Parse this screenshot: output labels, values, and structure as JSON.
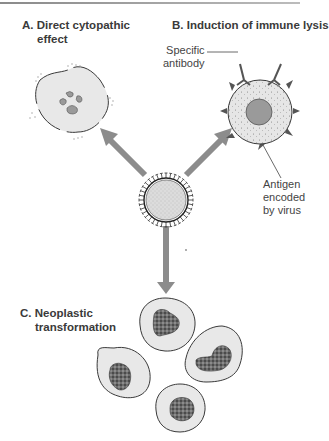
{
  "panels": {
    "a": {
      "letter": "A.",
      "line1": "Direct cytopathic",
      "line2": "effect"
    },
    "b": {
      "letter": "B.",
      "line1": "Induction of immune lysis"
    },
    "c": {
      "letter": "C.",
      "line1": "Neoplastic",
      "line2": "transformation"
    }
  },
  "annotations": {
    "antibody": {
      "line1": "Specific",
      "line2": "antibody"
    },
    "antigen": {
      "line1": "Antigen",
      "line2": "encoded",
      "line3": "by virus"
    }
  },
  "colors": {
    "arrow": "#8c8c8c",
    "cell_fill": "#e8e8e8",
    "outline": "#3a3a3a",
    "nucleus": "#9a9a9a",
    "text": "#3a3a3a"
  }
}
